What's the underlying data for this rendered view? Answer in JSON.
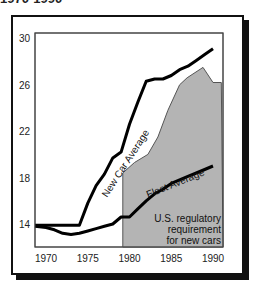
{
  "title": "1970-1990",
  "chart_data": {
    "type": "line",
    "title": "1970-1990",
    "xlabel": "",
    "ylabel": "",
    "x": [
      1970,
      1971,
      1972,
      1973,
      1974,
      1975,
      1976,
      1977,
      1978,
      1979,
      1980,
      1981,
      1982,
      1983,
      1984,
      1985,
      1986,
      1987,
      1988,
      1989,
      1990
    ],
    "series": [
      {
        "name": "New Car Average",
        "values": [
          13.9,
          13.9,
          13.9,
          13.9,
          13.9,
          15.8,
          17.3,
          18.3,
          19.7,
          20.2,
          22.6,
          24.5,
          26.3,
          26.5,
          26.5,
          26.8,
          27.3,
          27.6,
          28.1,
          28.6,
          29.1
        ]
      },
      {
        "name": "Fleet Average",
        "values": [
          13.7,
          13.5,
          13.2,
          13.1,
          13.2,
          13.4,
          13.6,
          13.8,
          14.0,
          14.6,
          14.6,
          15.3,
          16.0,
          16.6,
          17.0,
          17.5,
          17.8,
          18.1,
          18.4,
          18.7,
          19.0
        ]
      },
      {
        "name": "U.S. regulatory requirement for new cars",
        "type": "area",
        "x": [
          1979.2,
          1980.6,
          1982.2,
          1983.4,
          1984.6,
          1986,
          1986.9,
          1988.8,
          1990,
          1991
        ],
        "values": [
          18.4,
          19.3,
          20.0,
          21.5,
          23.8,
          26.0,
          26.6,
          27.5,
          26.2,
          26.2
        ]
      }
    ],
    "xticks": [
      "1970",
      "1975",
      "1980",
      "1985",
      "1990"
    ],
    "yticks": [
      "14",
      "18",
      "22",
      "26",
      "30"
    ],
    "xlim": [
      1968.7,
      1991
    ],
    "ylim": [
      12,
      30.5
    ],
    "grid": false,
    "annotations": [
      "New Car Average",
      "Fleet Average",
      "U.S. regulatory",
      "requirement",
      "for new cars"
    ],
    "colors": {
      "lines": "#000000",
      "area": "#b4b4b4",
      "area_edge": "#555555"
    }
  }
}
